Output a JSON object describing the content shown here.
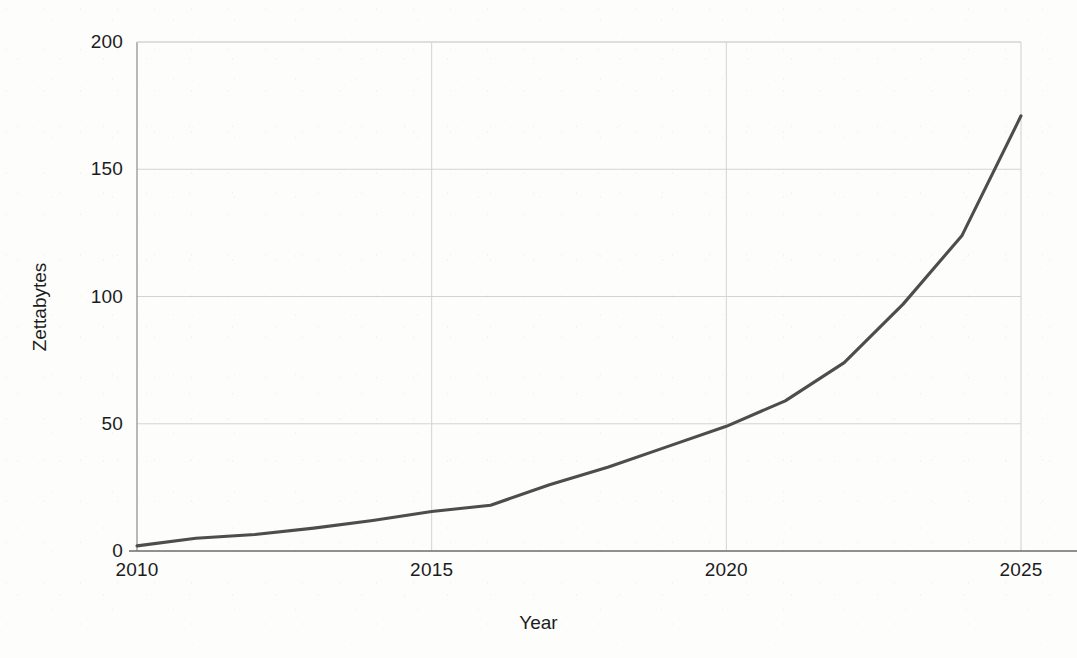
{
  "chart_data": {
    "type": "line",
    "title": "",
    "xlabel": "Year",
    "ylabel": "Zettabytes",
    "xlim": [
      2010,
      2025
    ],
    "ylim": [
      0,
      200
    ],
    "grid": true,
    "legend": "none",
    "line_color": "#4d4d4d",
    "x": [
      2010,
      2011,
      2012,
      2013,
      2014,
      2015,
      2016,
      2017,
      2018,
      2019,
      2020,
      2021,
      2022,
      2023,
      2024,
      2025
    ],
    "series": [
      {
        "name": "Global data volume",
        "values": [
          2,
          5,
          6.5,
          9,
          12,
          15.5,
          18,
          26,
          33,
          41,
          49,
          59,
          74,
          97,
          124,
          171
        ]
      }
    ],
    "x_ticks": [
      2010,
      2015,
      2020,
      2025
    ],
    "x_tick_labels": [
      "2010",
      "2015",
      "2020",
      "2025"
    ],
    "y_ticks": [
      0,
      50,
      100,
      150,
      200
    ],
    "y_tick_labels": [
      "0",
      "50",
      "100",
      "150",
      "200"
    ]
  },
  "axes": {
    "x_title": "Year",
    "y_title": "Zettabytes"
  },
  "colors": {
    "line": "#4d4d4d",
    "grid": "#d4d4d4",
    "axis": "#808080",
    "background": "#fdfdfc",
    "text": "#1c1c1c"
  }
}
